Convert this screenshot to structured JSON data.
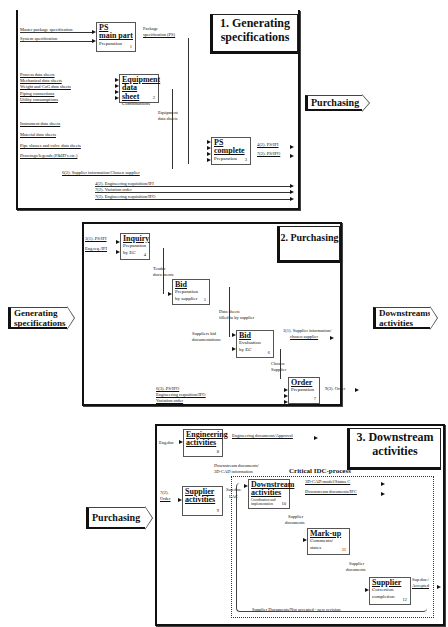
{
  "panel1": {
    "title_line1": "1. Generating",
    "title_line2": "specifications",
    "boxes": [
      {
        "id": 1,
        "title_line1": "PS",
        "title_line2": "main part",
        "subtitle": "Preparation",
        "number": "1"
      },
      {
        "id": 2,
        "title_line1": "Equipment",
        "title_line2": "data sheet",
        "subtitle": "Combinations",
        "number": "2"
      },
      {
        "id": 3,
        "title_line1": "PS",
        "title_line2": "complete",
        "subtitle": "Preparation",
        "number": "3"
      }
    ],
    "inputs_box1": [
      "Master package specification",
      "System specification"
    ],
    "output_box1_line1": "Package",
    "output_box1_line2": "specification (PS)",
    "inputs_box2": [
      "Process data sheets",
      "Mechanical data sheets",
      "Weight and CoG data sheets",
      "Piping connections",
      "Utility consumptions"
    ],
    "output_box2_line1": "Equipment",
    "output_box2_line2": "data sheets",
    "inputs_box3": [
      "Instrument data sheets",
      "Material data sheets",
      "Pipe classes and valve data sheets",
      "Drawings/legends (P&ID's etc.)"
    ],
    "supplier_info": "6(2). Supplier information/Chosen supplier",
    "outputs_box3": [
      "4(2). PS/IFI",
      "7(2). PS/IFO"
    ],
    "passthrough": [
      "4(2). Engineering requisition/IFI",
      "7(2). Variation order",
      "7(2). Engineering requisition/IFO"
    ],
    "nav_right": "Purchasing"
  },
  "panel2": {
    "title": "2. Purchasing",
    "nav_left_line1": "Generating",
    "nav_left_line2": "specifications",
    "nav_right_line1": "Downstreams",
    "nav_right_line2": "activities",
    "boxes": [
      {
        "id": 4,
        "title": "Inquiry",
        "subtitle_line1": "Preparation",
        "subtitle_line2": "by EC",
        "number": "4"
      },
      {
        "id": 5,
        "title": "Bid",
        "subtitle_line1": "Preparation",
        "subtitle_line2": "by supplier",
        "number": "5"
      },
      {
        "id": 6,
        "title": "Bid",
        "subtitle_line1": "Evaluation",
        "subtitle_line2": "by EC",
        "number": "6"
      },
      {
        "id": 7,
        "title": "Order",
        "subtitle_line1": "Preparation",
        "subtitle_line2": "",
        "number": "7"
      }
    ],
    "inputs_box4": [
      "3(1). PS/IFI",
      "Eng.req./IFI"
    ],
    "tender_line1": "Tender",
    "tender_line2": "docu ments",
    "data_sheets_line1": "Data sheets",
    "data_sheets_line2": "filled in by supplier",
    "suppliers_bid_line1": "Suppliers bid",
    "suppliers_bid_line2": "documentations",
    "supplier_info_line1": "3(1). Supplier information/",
    "supplier_info_line2": "chosen supplier",
    "chosen_line1": "Chosen",
    "chosen_line2": "Supplier",
    "inputs_box7": [
      "6(3). PS/IFO",
      "Engineering requsition/IFO",
      "Variation order"
    ],
    "output_order": "9(3). Order"
  },
  "panel3": {
    "title_line1": "3. Downstream",
    "title_line2": "activities",
    "nav_left": "Purchasing",
    "critical_label": "Critical IDC-process",
    "boxes": [
      {
        "id": 8,
        "title_line1": "Engineering",
        "title_line2": "activities",
        "subtitle": "",
        "number": "8"
      },
      {
        "id": 9,
        "title_line1": "Supplier",
        "title_line2": "activities",
        "subtitle": "",
        "number": "9"
      },
      {
        "id": 10,
        "title_line1": "Downstream",
        "title_line2": "activities",
        "subtitle": "Coordination and implementation",
        "number": "10"
      },
      {
        "id": 11,
        "title_line1": "Mark-up",
        "title_line2": "",
        "subtitle": "Comments/ states",
        "number": "11"
      },
      {
        "id": 12,
        "title_line1": "Supplier",
        "title_line2": "",
        "subtitle": "Correction completion",
        "number": "12"
      }
    ],
    "eng_input": "Eng.doc",
    "eng_output": "Engineering documents/Approval",
    "downstream_docs_line1": "Downstream documents/",
    "downstream_docs_line2": "3D-CAD information",
    "order_input_line1": "7(2).",
    "order_input_line2": "Order",
    "sup_doc_line1": "Sup.doc.",
    "sup_doc_line2": "LAC",
    "outputs_box10": [
      "3D-CAD model/Status C",
      "Downstream documents/IFC"
    ],
    "supplier_docs_1_line1": "Supplier",
    "supplier_docs_1_line2": "documents",
    "supplier_docs_2_line1": "Supplier",
    "supplier_docs_2_line2": "documents",
    "accepted_line1": "Sup.doc./",
    "accepted_line2": "Accepted",
    "loop_back": "Supplier Documents/Not accepted - new revision"
  }
}
